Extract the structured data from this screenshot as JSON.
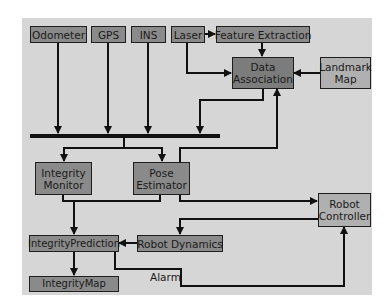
{
  "diagram": {
    "nodes": {
      "odometer": "Odometer",
      "gps": "GPS",
      "ins": "INS",
      "laser": "Laser",
      "feature_extraction": "Feature Extraction",
      "data_association": "Data Association",
      "landmark_map": "Landmark Map",
      "integrity_monitor": "Integrity Monitor",
      "pose_estimator": "Pose Estimator",
      "robot_controller": "Robot Controller",
      "integrity_prediction": "IntegrityPrediction",
      "robot_dynamics": "Robot Dynamics",
      "integrity_map": "IntegrityMap"
    },
    "edge_labels": {
      "alarm": "Alarm"
    },
    "edges": [
      {
        "from": "Laser",
        "to": "Feature Extraction"
      },
      {
        "from": "Feature Extraction",
        "to": "Data Association"
      },
      {
        "from": "Laser",
        "to": "Data Association"
      },
      {
        "from": "Landmark Map",
        "to": "Data Association"
      },
      {
        "from": "Odometer",
        "to": "Bus"
      },
      {
        "from": "GPS",
        "to": "Bus"
      },
      {
        "from": "INS",
        "to": "Bus"
      },
      {
        "from": "Data Association",
        "to": "Bus"
      },
      {
        "from": "Bus",
        "to": "Integrity Monitor"
      },
      {
        "from": "Bus",
        "to": "Pose Estimator"
      },
      {
        "from": "Pose Estimator",
        "to": "Data Association"
      },
      {
        "from": "Pose Estimator",
        "to": "Robot Controller"
      },
      {
        "from": "Integrity Monitor",
        "to": "Integrity Prediction"
      },
      {
        "from": "Pose Estimator",
        "to": "Integrity Prediction"
      },
      {
        "from": "Robot Controller",
        "to": "Robot Dynamics"
      },
      {
        "from": "Robot Dynamics",
        "to": "Integrity Prediction"
      },
      {
        "from": "Integrity Prediction",
        "to": "Integrity Map"
      },
      {
        "from": "Integrity Prediction",
        "to": "Robot Controller",
        "label": "Alarm"
      }
    ]
  }
}
